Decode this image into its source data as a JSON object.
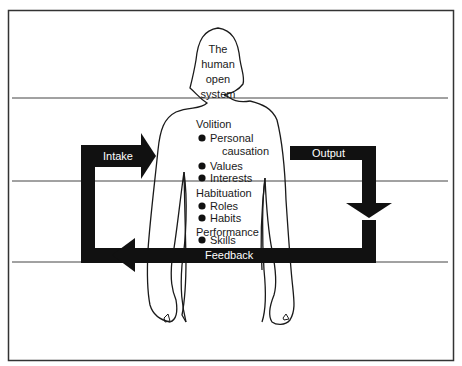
{
  "diagram": {
    "head_text": [
      "The",
      "human",
      "open",
      "system"
    ],
    "sections": [
      {
        "heading": "Volition",
        "items": [
          "Personal",
          "causation",
          "Values",
          "Interests"
        ]
      },
      {
        "heading": "Habituation",
        "items": [
          "Roles",
          "Habits"
        ]
      },
      {
        "heading": "Performance",
        "items": [
          "Skills"
        ]
      }
    ],
    "arrows": {
      "intake": "Intake",
      "output": "Output",
      "feedback": "Feedback"
    },
    "colors": {
      "ink": "#1a1a1a",
      "background": "#ffffff",
      "frame": "#333333"
    }
  }
}
